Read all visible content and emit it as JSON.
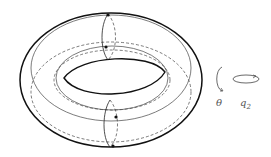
{
  "figure": {
    "labels": {
      "theta": "θ",
      "q2_base": "q",
      "q2_sub": "2"
    },
    "colors": {
      "stroke": "#111111",
      "light_stroke": "#444444",
      "background": "#ffffff"
    }
  }
}
